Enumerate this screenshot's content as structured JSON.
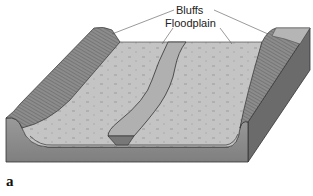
{
  "figure": {
    "letter": "a",
    "type": "block diagram"
  },
  "labels": {
    "bluffs": "Bluffs",
    "floodplain": "Floodplain"
  },
  "colors": {
    "surface": "#bdbdbd",
    "surface_light": "#c9c9c9",
    "front_face": "#8e8e8e",
    "side_face": "#6a6a6a",
    "bluff": "#8a8a8a",
    "channel": "#a9a9a9",
    "channel_cut": "#7a7a7a",
    "outline": "#333333",
    "leader": "#555555"
  }
}
